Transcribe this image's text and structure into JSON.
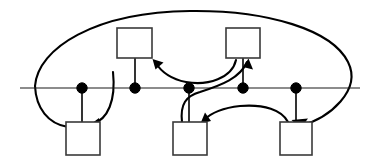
{
  "figure": {
    "title": "",
    "canvas": {
      "width": 375,
      "height": 165,
      "background": "#ffffff"
    },
    "stroke_color": "#000000",
    "box_stroke_color": "#3a3a3a",
    "box_fill_color": "#ffffff",
    "timeline_color": "#1a1a1a"
  },
  "timeline": {
    "name": "horizontal-timeline",
    "y": 88,
    "x_start": 20,
    "x_end": 360
  },
  "nodes": [
    {
      "id": "dot-1",
      "label": "",
      "cx": 82,
      "cy": 88,
      "r": 5.2
    },
    {
      "id": "dot-2",
      "label": "",
      "cx": 135,
      "cy": 88,
      "r": 5.2
    },
    {
      "id": "dot-3",
      "label": "",
      "cx": 189,
      "cy": 88,
      "r": 5.2
    },
    {
      "id": "dot-4",
      "label": "",
      "cx": 243,
      "cy": 88,
      "r": 5.2
    },
    {
      "id": "dot-5",
      "label": "",
      "cx": 296,
      "cy": 88,
      "r": 5.2
    }
  ],
  "boxes": [
    {
      "id": "box-top-left",
      "label": "",
      "x": 117,
      "y": 28,
      "width": 35,
      "height": 30
    },
    {
      "id": "box-top-right",
      "label": "",
      "x": 226,
      "y": 28,
      "width": 34,
      "height": 30
    },
    {
      "id": "box-bottom-left",
      "label": "",
      "x": 66,
      "y": 122,
      "width": 34,
      "height": 33
    },
    {
      "id": "box-bottom-middle",
      "label": "",
      "x": 173,
      "y": 122,
      "width": 34,
      "height": 33
    },
    {
      "id": "box-bottom-right",
      "label": "",
      "x": 280,
      "y": 122,
      "width": 32,
      "height": 33
    }
  ],
  "connectors": [
    {
      "id": "stem-dot1-to-bottom-left",
      "from": "dot-1",
      "to": "box-bottom-left",
      "style": "straight",
      "arrow": false
    },
    {
      "id": "stem-dot2-to-top-left",
      "from": "dot-2",
      "to": "box-top-left",
      "style": "straight",
      "arrow": false
    },
    {
      "id": "stem-dot3-to-bottom-middle",
      "from": "dot-3",
      "to": "box-bottom-middle",
      "style": "straight",
      "arrow": false
    },
    {
      "id": "stem-dot4-to-top-right",
      "from": "dot-4",
      "to": "box-top-right",
      "style": "straight",
      "arrow": false
    },
    {
      "id": "stem-dot5-to-bottom-right",
      "from": "dot-5",
      "to": "box-bottom-right",
      "style": "straight",
      "arrow": false
    },
    {
      "id": "arc-outer-to-bottom-right",
      "from": "box-bottom-left",
      "to": "box-bottom-right",
      "style": "large-outer-arc",
      "arrow": true
    },
    {
      "id": "arc-left-to-bottom-left",
      "from": "timeline-left",
      "to": "box-bottom-left",
      "style": "left-loop",
      "arrow": true
    },
    {
      "id": "arc-topright-to-topleft",
      "from": "box-top-right",
      "to": "box-top-left",
      "style": "sagging-arc",
      "arrow": true
    },
    {
      "id": "arc-dot3-to-top-right",
      "from": "dot-3",
      "to": "box-top-right",
      "style": "s-curve-up",
      "arrow": true
    },
    {
      "id": "arc-right-to-bottom-middle",
      "from": "box-bottom-right",
      "to": "box-bottom-middle",
      "style": "low-arc",
      "arrow": true
    }
  ],
  "legend": {
    "entries": []
  },
  "annotations": []
}
